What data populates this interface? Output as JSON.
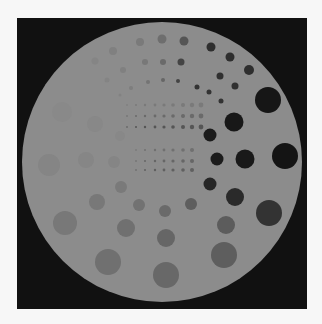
{
  "image": {
    "description": "CT contrast-detail phantom cross-section",
    "page_background": "#f7f7f7",
    "frame": {
      "x": 17,
      "y": 18,
      "w": 290,
      "h": 291,
      "color": "#111111"
    },
    "phantom": {
      "cx": 162,
      "cy": 162,
      "r": 140,
      "color": "#8c8c8c"
    },
    "dot_grids": [
      {
        "rows_y": [
          105,
          116,
          127
        ],
        "cols_x": [
          127,
          136,
          145,
          155,
          164,
          173,
          183,
          192,
          201
        ],
        "r": [
          0.8,
          1.0,
          1.2,
          1.4,
          1.6,
          1.8,
          2.0,
          2.2,
          2.4
        ],
        "colors": [
          "#7a7a7a",
          "#6a6a6a",
          "#555555"
        ]
      },
      {
        "rows_y": [
          150,
          161,
          170
        ],
        "cols_x": [
          136,
          145,
          155,
          164,
          173,
          183,
          192
        ],
        "r": [
          0.8,
          1.0,
          1.2,
          1.4,
          1.6,
          1.8,
          2.0
        ],
        "colors": [
          "#707070",
          "#666666",
          "#606060"
        ]
      }
    ],
    "disks": [
      {
        "x": 268,
        "y": 100,
        "r": 13,
        "c": "#161616"
      },
      {
        "x": 234,
        "y": 122,
        "r": 9.5,
        "c": "#181818"
      },
      {
        "x": 210,
        "y": 135,
        "r": 6.5,
        "c": "#1b1b1b"
      },
      {
        "x": 285,
        "y": 156,
        "r": 13,
        "c": "#141414"
      },
      {
        "x": 245,
        "y": 159,
        "r": 9.5,
        "c": "#191919"
      },
      {
        "x": 217,
        "y": 159,
        "r": 6.5,
        "c": "#1c1c1c"
      },
      {
        "x": 210,
        "y": 184,
        "r": 6.5,
        "c": "#262626"
      },
      {
        "x": 235,
        "y": 197,
        "r": 9,
        "c": "#2a2a2a"
      },
      {
        "x": 269,
        "y": 213,
        "r": 13,
        "c": "#333333"
      },
      {
        "x": 211,
        "y": 47,
        "r": 4.5,
        "c": "#2e2e2e"
      },
      {
        "x": 230,
        "y": 57,
        "r": 4.5,
        "c": "#2e2e2e"
      },
      {
        "x": 249,
        "y": 70,
        "r": 5,
        "c": "#2e2e2e"
      },
      {
        "x": 220,
        "y": 76,
        "r": 3.5,
        "c": "#303030"
      },
      {
        "x": 235,
        "y": 86,
        "r": 3.5,
        "c": "#303030"
      },
      {
        "x": 209,
        "y": 92,
        "r": 2.5,
        "c": "#333333"
      },
      {
        "x": 221,
        "y": 101,
        "r": 2.5,
        "c": "#333333"
      },
      {
        "x": 197,
        "y": 87,
        "r": 2.5,
        "c": "#333333"
      },
      {
        "x": 181,
        "y": 62,
        "r": 3.5,
        "c": "#444444"
      },
      {
        "x": 178,
        "y": 81,
        "r": 2,
        "c": "#444444"
      },
      {
        "x": 184,
        "y": 41,
        "r": 4.5,
        "c": "#555555"
      },
      {
        "x": 162,
        "y": 39,
        "r": 4.5,
        "c": "#6e6e6e"
      },
      {
        "x": 140,
        "y": 42,
        "r": 4,
        "c": "#7a7a7a"
      },
      {
        "x": 113,
        "y": 51,
        "r": 4,
        "c": "#808080"
      },
      {
        "x": 95,
        "y": 61,
        "r": 3.5,
        "c": "#858585"
      },
      {
        "x": 163,
        "y": 62,
        "r": 3,
        "c": "#6a6a6a"
      },
      {
        "x": 145,
        "y": 62,
        "r": 3,
        "c": "#787878"
      },
      {
        "x": 123,
        "y": 70,
        "r": 3,
        "c": "#808080"
      },
      {
        "x": 107,
        "y": 80,
        "r": 2.5,
        "c": "#848484"
      },
      {
        "x": 163,
        "y": 80,
        "r": 2,
        "c": "#666666"
      },
      {
        "x": 148,
        "y": 82,
        "r": 2,
        "c": "#747474"
      },
      {
        "x": 131,
        "y": 88,
        "r": 2,
        "c": "#7e7e7e"
      },
      {
        "x": 120,
        "y": 95,
        "r": 1.5,
        "c": "#828282"
      },
      {
        "x": 191,
        "y": 204,
        "r": 6,
        "c": "#5e5e5e"
      },
      {
        "x": 226,
        "y": 225,
        "r": 9,
        "c": "#5c5c5c"
      },
      {
        "x": 224,
        "y": 255,
        "r": 13,
        "c": "#5e5e5e"
      },
      {
        "x": 165,
        "y": 211,
        "r": 6,
        "c": "#6a6a6a"
      },
      {
        "x": 166,
        "y": 238,
        "r": 9,
        "c": "#666666"
      },
      {
        "x": 166,
        "y": 275,
        "r": 13,
        "c": "#686868"
      },
      {
        "x": 139,
        "y": 205,
        "r": 6,
        "c": "#727272"
      },
      {
        "x": 126,
        "y": 228,
        "r": 9,
        "c": "#707070"
      },
      {
        "x": 108,
        "y": 262,
        "r": 13,
        "c": "#707070"
      },
      {
        "x": 121,
        "y": 187,
        "r": 6,
        "c": "#7a7a7a"
      },
      {
        "x": 97,
        "y": 202,
        "r": 8,
        "c": "#787878"
      },
      {
        "x": 65,
        "y": 223,
        "r": 12,
        "c": "#787878"
      },
      {
        "x": 114,
        "y": 162,
        "r": 6,
        "c": "#858585"
      },
      {
        "x": 86,
        "y": 160,
        "r": 8,
        "c": "#868686"
      },
      {
        "x": 49,
        "y": 165,
        "r": 11,
        "c": "#858585"
      },
      {
        "x": 120,
        "y": 136,
        "r": 5,
        "c": "#888888"
      },
      {
        "x": 95,
        "y": 124,
        "r": 8,
        "c": "#888888"
      },
      {
        "x": 62,
        "y": 112,
        "r": 10,
        "c": "#898989"
      }
    ]
  }
}
